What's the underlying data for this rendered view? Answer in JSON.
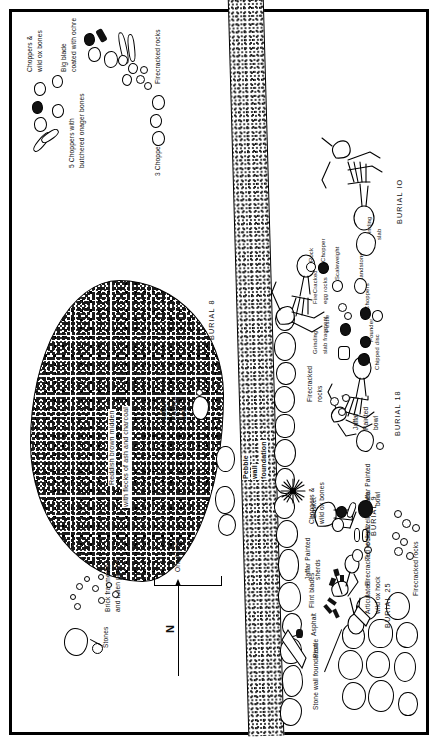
{
  "figure": {
    "type": "archaeological-site-plan",
    "orientation": "rotated-90-ccw",
    "frame": "thick black rectangular border"
  },
  "burials": [
    {
      "id": "burial-18",
      "label": "BURIAL 18"
    },
    {
      "id": "burial-10",
      "label": "BURIAL IO"
    },
    {
      "id": "burial-25",
      "label": "BURIAL 25"
    },
    {
      "id": "burial-9",
      "label": "BURIAL 9"
    },
    {
      "id": "burial-8",
      "label": "BURIAL 8"
    }
  ],
  "features": {
    "midden": {
      "line1": "Reddish brown midden",
      "line2": "with flecks of ash and charcoal"
    },
    "pebble_wall": {
      "line1": "Pebble",
      "line2": "wall",
      "line3": "foundation"
    },
    "stone_wall": {
      "label": "Stone wall foundation"
    },
    "basket": {
      "label": "Basket"
    },
    "stones": {
      "label": "Stones"
    },
    "brick": {
      "line1": "Brick fragments",
      "line2": "and fallen plaster"
    }
  },
  "annotations": {
    "top_left": {
      "line1": "Choppers &",
      "line2": "wild ox bones",
      "line3": "Big blade",
      "line4": "coated with ochre"
    },
    "onager": {
      "line1": "5 Choppers with",
      "line2": "butchered onager bones"
    },
    "three_choppers": "3 Choppers",
    "firecracked_right": "Firecracked rocks",
    "jaffar_bowl_upper": {
      "line1": "Jaffar",
      "line2": "Painted",
      "line3": "bowl"
    },
    "artifact_row": [
      {
        "id": "rock",
        "label": "Rock"
      },
      {
        "id": "chopper",
        "label": "Chopper"
      },
      {
        "id": "scaleweight",
        "label": "Scaleweight"
      },
      {
        "id": "firecracked-egg",
        "line1": "FireCracked",
        "line2": "egg rocks"
      },
      {
        "id": "pestle",
        "label": "Pestle"
      },
      {
        "id": "grinding-frag",
        "line1": "Grinding",
        "line2": "slab fragment"
      },
      {
        "id": "handstone",
        "label": "Handstone"
      },
      {
        "id": "choppers",
        "label": "Choppers"
      },
      {
        "id": "pounder",
        "label": "Pounder"
      },
      {
        "id": "chipped-disc",
        "label": "Chipped disc"
      },
      {
        "id": "grinding-slab",
        "line1": "Grinding",
        "line2": "slab"
      }
    ],
    "firecracked_mid": {
      "line1": "Firecracked",
      "line2": "rocks"
    },
    "jaffar_bowl_mid": {
      "line1": "Jaffar",
      "line2": "Painted",
      "line3": "bowl"
    },
    "choppers_ox": {
      "line1": "Choppers &",
      "line2": "wild ox bones"
    },
    "jaffar_sherds": {
      "line1": "Jaffar Painted",
      "line2": "sherds"
    },
    "flint_blades": "Flint blades",
    "asphalt": "Asphalt",
    "pestle_right": "Pestle",
    "jaffar_bowl_lower": {
      "line1": "Jaffar Painted",
      "line2": "bowl"
    },
    "gazelle": "Gazelle bones",
    "turtle": "Turtle shell",
    "firecracked_lower": "Firecracked rocks",
    "articulated": {
      "line1": "Articulated",
      "line2": "wild ox hock"
    },
    "firecracked_bottom": "Firecracked rocks"
  },
  "scale": {
    "label": "One Meter"
  },
  "compass": {
    "label": "N"
  },
  "colors": {
    "ink": "#000000",
    "paper": "#ffffff"
  }
}
